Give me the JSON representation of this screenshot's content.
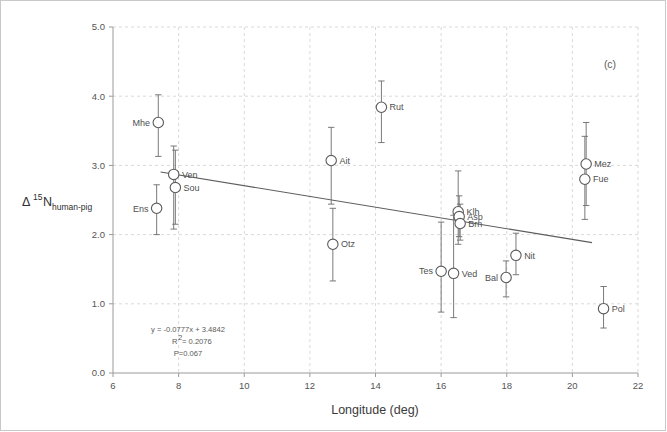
{
  "figure": {
    "panel_label": "(c)",
    "background_color": "#ffffff"
  },
  "axes": {
    "x": {
      "label": "Longitude  (deg)",
      "min": 6,
      "max": 22,
      "ticks": [
        6,
        8,
        10,
        12,
        14,
        16,
        18,
        20,
        22
      ],
      "tick_labels": [
        "6",
        "8",
        "10",
        "12",
        "14",
        "16",
        "18",
        "20",
        "22"
      ]
    },
    "y": {
      "label_delta": "Δ",
      "label_sup": "15",
      "label_n": "N",
      "label_sub": "human-pig",
      "label_plain": "Δ15Nhuman-pig",
      "min": 0.0,
      "max": 5.0,
      "ticks": [
        0.0,
        1.0,
        2.0,
        3.0,
        4.0,
        5.0
      ],
      "tick_labels": [
        "0.0",
        "1.0",
        "2.0",
        "3.0",
        "4.0",
        "5.0"
      ]
    }
  },
  "annotations": {
    "equation": "y = -0.0777x + 3.4842",
    "r_squared_prefix": "R",
    "r_squared_sup": "2",
    "r_squared_value": " = 0.2076",
    "r_squared_plain": "R2 = 0.2076",
    "p_value": "P=0.067"
  },
  "regression": {
    "slope": -0.0777,
    "intercept": 3.4842,
    "x_start": 7.45,
    "x_end": 20.6,
    "color": "#5d5d5d"
  },
  "chart_data": {
    "type": "scatter",
    "title": "",
    "subtitle": "",
    "xlabel": "Longitude  (deg)",
    "ylabel": "Δ15N human-pig",
    "xlim": [
      6,
      22
    ],
    "ylim": [
      0.0,
      5.0
    ],
    "grid": "dashed-vertical-and-horizontal",
    "legend": "none",
    "marker": "open-circle",
    "error_bars": "vertical",
    "annotations": [
      "y = -0.0777x + 3.4842",
      "R2 = 0.2076",
      "P=0.067",
      "(c)"
    ],
    "points": [
      {
        "name": "Mhe",
        "x": 7.38,
        "y": 3.62,
        "err_low": 3.13,
        "err_high": 4.02,
        "label_side": "left"
      },
      {
        "name": "Ven",
        "x": 7.85,
        "y": 2.87,
        "err_low": 2.08,
        "err_high": 3.28,
        "label_side": "right"
      },
      {
        "name": "Sou",
        "x": 7.9,
        "y": 2.68,
        "err_low": 2.15,
        "err_high": 3.22,
        "label_side": "right"
      },
      {
        "name": "Ens",
        "x": 7.33,
        "y": 2.38,
        "err_low": 2.0,
        "err_high": 2.72,
        "label_side": "left"
      },
      {
        "name": "Ait",
        "x": 12.65,
        "y": 3.07,
        "err_low": 2.44,
        "err_high": 3.55,
        "label_side": "right"
      },
      {
        "name": "Otz",
        "x": 12.7,
        "y": 1.86,
        "err_low": 1.33,
        "err_high": 2.38,
        "label_side": "right"
      },
      {
        "name": "Rut",
        "x": 14.18,
        "y": 3.84,
        "err_low": 3.33,
        "err_high": 4.22,
        "label_side": "right"
      },
      {
        "name": "Tes",
        "x": 16.0,
        "y": 1.47,
        "err_low": 0.88,
        "err_high": 2.18,
        "label_side": "left"
      },
      {
        "name": "Ved",
        "x": 16.38,
        "y": 1.44,
        "err_low": 0.8,
        "err_high": 2.28,
        "label_side": "right"
      },
      {
        "name": "Klh",
        "x": 16.52,
        "y": 2.33,
        "err_low": 1.86,
        "err_high": 2.92,
        "label_side": "right"
      },
      {
        "name": "Asp",
        "x": 16.55,
        "y": 2.26,
        "err_low": 1.97,
        "err_high": 2.56,
        "label_side": "right"
      },
      {
        "name": "Brn",
        "x": 16.58,
        "y": 2.16,
        "err_low": 1.92,
        "err_high": 2.44,
        "label_side": "right"
      },
      {
        "name": "Bal",
        "x": 17.98,
        "y": 1.38,
        "err_low": 1.1,
        "err_high": 1.62,
        "label_side": "left"
      },
      {
        "name": "Nit",
        "x": 18.28,
        "y": 1.7,
        "err_low": 1.42,
        "err_high": 2.02,
        "label_side": "right"
      },
      {
        "name": "Mez",
        "x": 20.42,
        "y": 3.02,
        "err_low": 2.42,
        "err_high": 3.62,
        "label_side": "right"
      },
      {
        "name": "Fue",
        "x": 20.38,
        "y": 2.8,
        "err_low": 2.22,
        "err_high": 3.42,
        "label_side": "right"
      },
      {
        "name": "Pol",
        "x": 20.95,
        "y": 0.93,
        "err_low": 0.65,
        "err_high": 1.25,
        "label_side": "right"
      }
    ]
  },
  "style": {
    "marker_stroke": "#5a5a5a",
    "marker_fill": "#ffffff",
    "errorbar_color": "#6b6b6b",
    "grid_color": "#cfcfcf",
    "axis_color": "#9a9a9a",
    "text_color": "#555555"
  }
}
